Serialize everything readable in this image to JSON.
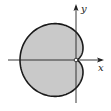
{
  "chart_data": {
    "type": "polar-curve",
    "title": "",
    "equation": "r = 1 - cos(theta)",
    "parameters": {
      "a": 1
    },
    "theta_range": [
      0,
      6.283185
    ],
    "xlabel": "x",
    "ylabel": "y",
    "xlim": [
      -2.2,
      1.0
    ],
    "ylim": [
      -1.5,
      2.0
    ],
    "grid": false,
    "shaded": true,
    "colors": {
      "fill": "#c9c9c9",
      "stroke": "#1a1a1a",
      "axis": "#222222",
      "origin_marker": "#ffffff"
    }
  }
}
